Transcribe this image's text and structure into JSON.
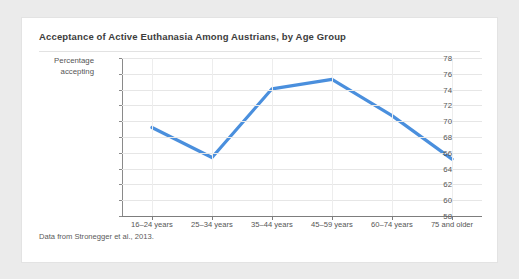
{
  "figure": {
    "title": "Acceptance of Active Euthanasia Among Austrians, by Age Group",
    "source_note": "Data from Stronegger et al., 2013.",
    "ylabel_line1": "Percentage",
    "ylabel_line2": "accepting",
    "line_color": "#4a8fdd",
    "card_background": "#ffffff",
    "page_background": "#ebebeb",
    "grid_color": "#e6e6e6",
    "axis_color": "#7d7d7d",
    "text_color": "#555555"
  },
  "chart_data": {
    "type": "line",
    "title": "Acceptance of Active Euthanasia Among Austrians, by Age Group",
    "xlabel": "",
    "ylabel": "Percentage accepting",
    "categories": [
      "16–24 years",
      "25–34 years",
      "35–44 years",
      "45–59 years",
      "60–74 years",
      "75 and older"
    ],
    "values": [
      69.2,
      65.4,
      74.1,
      75.3,
      70.7,
      65.2
    ],
    "ylim": [
      58,
      78
    ],
    "ytick_values": [
      58,
      60,
      62,
      64,
      66,
      68,
      70,
      72,
      74,
      76,
      78
    ],
    "ytick_labels": [
      "58",
      "60",
      "62",
      "64",
      "66",
      "68",
      "70",
      "72",
      "74",
      "76",
      "78"
    ],
    "grid": true,
    "grid_axis": "both",
    "legend": false,
    "legend_position": "none",
    "series": [
      {
        "name": "Percentage accepting",
        "color": "#4a8fdd",
        "values": [
          69.2,
          65.4,
          74.1,
          75.3,
          70.7,
          65.2
        ]
      }
    ]
  }
}
